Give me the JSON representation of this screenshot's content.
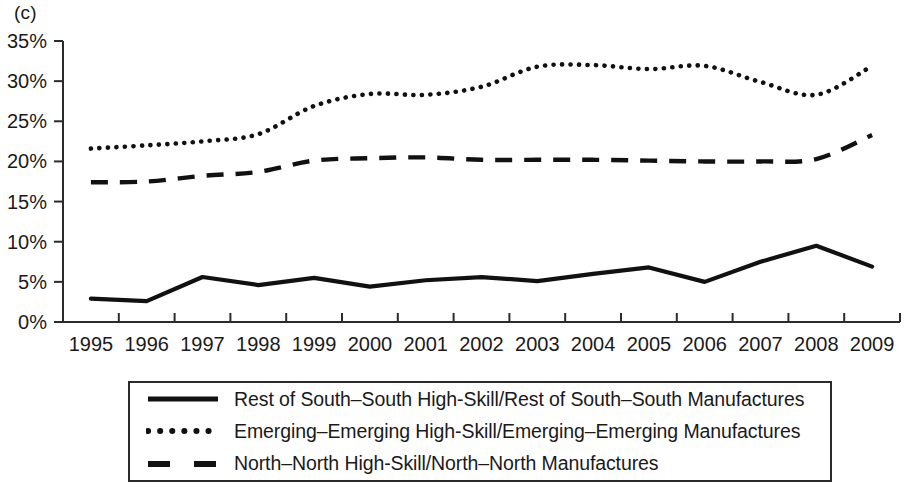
{
  "figure": {
    "panel_label": "(c)"
  },
  "axes": {
    "y_ticks": [
      "0%",
      "5%",
      "10%",
      "15%",
      "20%",
      "25%",
      "30%",
      "35%"
    ],
    "x_ticks": [
      "1995",
      "1996",
      "1997",
      "1998",
      "1999",
      "2000",
      "2001",
      "2002",
      "2003",
      "2004",
      "2005",
      "2006",
      "2007",
      "2008",
      "2009"
    ]
  },
  "legend": {
    "items": [
      {
        "label": "Rest of South–South High-Skill/Rest of South–South Manufactures",
        "style": "solid",
        "icon": "solid-line-icon"
      },
      {
        "label": "Emerging–Emerging High-Skill/Emerging–Emerging Manufactures",
        "style": "dotted",
        "icon": "dotted-line-icon"
      },
      {
        "label": "North–North High-Skill/North–North Manufactures",
        "style": "dashed",
        "icon": "dashed-line-icon"
      }
    ]
  },
  "chart_data": {
    "type": "line",
    "title": "(c)",
    "xlabel": "",
    "ylabel": "",
    "x": [
      1995,
      1996,
      1997,
      1998,
      1999,
      2000,
      2001,
      2002,
      2003,
      2004,
      2005,
      2006,
      2007,
      2008,
      2009
    ],
    "xlim": [
      1995,
      2009
    ],
    "ylim": [
      0,
      35
    ],
    "y_unit": "percent",
    "grid": false,
    "legend_position": "below-axes",
    "series": [
      {
        "name": "Rest of South–South High-Skill/Rest of South–South Manufactures",
        "style": "solid",
        "color": "#111111",
        "values": [
          2.9,
          2.6,
          5.6,
          4.6,
          5.5,
          4.4,
          5.2,
          5.6,
          5.1,
          6.0,
          6.8,
          5.0,
          7.5,
          9.5,
          6.9
        ]
      },
      {
        "name": "Emerging–Emerging High-Skill/Emerging–Emerging Manufactures",
        "style": "dotted",
        "color": "#111111",
        "values": [
          21.6,
          22.0,
          22.5,
          23.4,
          26.9,
          28.4,
          28.3,
          29.3,
          31.8,
          32.0,
          31.5,
          31.9,
          29.9,
          28.3,
          31.9
        ]
      },
      {
        "name": "North–North High-Skill/North–North Manufactures",
        "style": "dashed",
        "color": "#111111",
        "values": [
          17.4,
          17.5,
          18.2,
          18.7,
          20.1,
          20.4,
          20.5,
          20.2,
          20.2,
          20.2,
          20.1,
          20.0,
          20.0,
          20.3,
          23.3
        ]
      }
    ]
  }
}
